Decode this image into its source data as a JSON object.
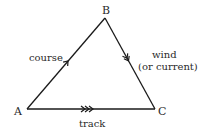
{
  "diagram": {
    "type": "vector-triangle",
    "vertices": [
      {
        "id": "A",
        "label": "A"
      },
      {
        "id": "B",
        "label": "B"
      },
      {
        "id": "C",
        "label": "C"
      }
    ],
    "edges": [
      {
        "from": "A",
        "to": "B",
        "label": "course",
        "arrow": "single"
      },
      {
        "from": "B",
        "to": "C",
        "label_line1": "wind",
        "label_line2": "(or current)",
        "arrow": "double"
      },
      {
        "from": "A",
        "to": "C",
        "label": "track",
        "arrow": "triple"
      }
    ],
    "colors": {
      "line": "#1a1a1a",
      "text": "#2a2a2a",
      "background": "#ffffff"
    }
  }
}
